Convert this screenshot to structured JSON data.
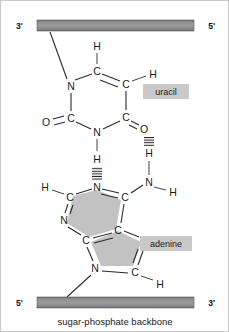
{
  "figure": {
    "caption": "sugar-phosphate backbone",
    "colors": {
      "backbone_bar": "#8c8c8c",
      "backbone_bar_edge": "#6e6e6e",
      "ring_shade": "#c2c2c2",
      "label_box": "#c9c9c9",
      "bond": "#2b2b2b",
      "text": "#1a1a1a",
      "border": "#c8c8c8"
    }
  },
  "backbones": {
    "top": {
      "left_label": "3'",
      "right_label": "5'"
    },
    "bottom": {
      "left_label": "5'",
      "right_label": "3'"
    }
  },
  "labels": {
    "uracil": "uracil",
    "adenine": "adenine"
  },
  "uracil": {
    "name": "uracil",
    "atoms": [
      {
        "id": "u-h-top",
        "text": "H",
        "x": 96,
        "y": 45
      },
      {
        "id": "u-c5",
        "text": "C",
        "x": 96,
        "y": 70
      },
      {
        "id": "u-c6",
        "text": "C",
        "x": 125,
        "y": 83
      },
      {
        "id": "u-h-right",
        "text": "H",
        "x": 152,
        "y": 73
      },
      {
        "id": "u-n1",
        "text": "N",
        "x": 70,
        "y": 85
      },
      {
        "id": "u-c2",
        "text": "C",
        "x": 70,
        "y": 117
      },
      {
        "id": "u-o2",
        "text": "O",
        "x": 45,
        "y": 121
      },
      {
        "id": "u-n3",
        "text": "N",
        "x": 96,
        "y": 131
      },
      {
        "id": "u-c4",
        "text": "C",
        "x": 125,
        "y": 116
      },
      {
        "id": "u-o4",
        "text": "O",
        "x": 143,
        "y": 128
      }
    ]
  },
  "adenine": {
    "name": "adenine",
    "atoms": [
      {
        "id": "a-n1",
        "text": "N",
        "x": 96,
        "y": 186
      },
      {
        "id": "a-h-n1",
        "text": "H",
        "x": 96,
        "y": 158
      },
      {
        "id": "a-c2",
        "text": "C",
        "x": 69,
        "y": 196
      },
      {
        "id": "a-h-c2",
        "text": "H",
        "x": 44,
        "y": 186
      },
      {
        "id": "a-n3",
        "text": "N",
        "x": 63,
        "y": 219
      },
      {
        "id": "a-c4",
        "text": "C",
        "x": 85,
        "y": 239
      },
      {
        "id": "a-c5",
        "text": "C",
        "x": 117,
        "y": 229
      },
      {
        "id": "a-c6",
        "text": "C",
        "x": 124,
        "y": 196
      },
      {
        "id": "a-n6",
        "text": "N",
        "x": 148,
        "y": 181
      },
      {
        "id": "a-h-n6a",
        "text": "H",
        "x": 148,
        "y": 152
      },
      {
        "id": "a-h-n6b",
        "text": "H",
        "x": 172,
        "y": 191
      },
      {
        "id": "a-n7",
        "text": "N",
        "x": 144,
        "y": 243
      },
      {
        "id": "a-c8",
        "text": "C",
        "x": 134,
        "y": 271
      },
      {
        "id": "a-h-c8",
        "text": "H",
        "x": 159,
        "y": 283
      },
      {
        "id": "a-n9",
        "text": "N",
        "x": 94,
        "y": 267
      }
    ]
  },
  "hydrogen_bonds": [
    {
      "id": "hb-left",
      "from": "uracil-N3-H",
      "to": "adenine-N1",
      "x": 96,
      "y1": 166,
      "y2": 178
    },
    {
      "id": "hb-right",
      "from": "uracil-O4",
      "to": "adenine-N6-H",
      "x": 148,
      "y1": 136,
      "y2": 145
    }
  ]
}
